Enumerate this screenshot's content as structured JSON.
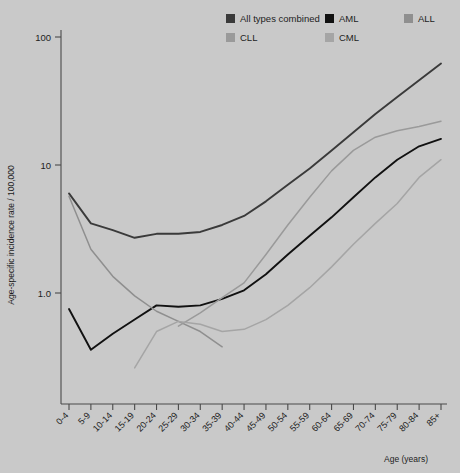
{
  "chart_data": {
    "type": "line",
    "title": "",
    "xlabel": "Age (years)",
    "ylabel": "Age-specific incidence rate / 100,000",
    "yscale": "log",
    "ylim": [
      0.22,
      100
    ],
    "ytick_labels": [
      "100",
      "10",
      "1.0"
    ],
    "ytick_values": [
      100,
      10,
      1.0
    ],
    "grid": false,
    "legend_position": "top",
    "categories": [
      "0-4",
      "5-9",
      "10-14",
      "15-19",
      "20-24",
      "25-29",
      "30-34",
      "35-39",
      "40-44",
      "45-49",
      "50-54",
      "55-59",
      "60-64",
      "65-69",
      "70-74",
      "75-79",
      "80-84",
      "85+"
    ],
    "series": [
      {
        "name": "All types combined",
        "color": "#3a3a3a",
        "values": [
          6.0,
          3.5,
          3.1,
          2.7,
          2.9,
          2.9,
          3.0,
          3.4,
          4.0,
          5.2,
          7.0,
          9.4,
          13.0,
          18.0,
          25.0,
          34.0,
          46.0,
          62.0
        ]
      },
      {
        "name": "AML",
        "color": "#111111",
        "values": [
          0.75,
          0.36,
          0.48,
          0.62,
          0.8,
          0.78,
          0.8,
          0.9,
          1.05,
          1.4,
          2.0,
          2.8,
          3.9,
          5.6,
          8.0,
          11.0,
          14.0,
          16.0
        ]
      },
      {
        "name": "ALL",
        "color": "#8f8f8f",
        "values": [
          5.7,
          2.2,
          1.35,
          0.95,
          0.72,
          0.6,
          0.5,
          0.38,
          null,
          null,
          null,
          null,
          null,
          null,
          null,
          null,
          null,
          null
        ]
      },
      {
        "name": "CLL",
        "color": "#9a9a9a",
        "values": [
          null,
          null,
          null,
          null,
          null,
          0.55,
          0.7,
          0.92,
          1.2,
          2.0,
          3.4,
          5.6,
          9.0,
          13.0,
          16.5,
          18.5,
          20.0,
          22.0
        ]
      },
      {
        "name": "CML",
        "color": "#a5a5a5",
        "values": [
          null,
          null,
          null,
          0.26,
          0.5,
          0.6,
          0.57,
          0.5,
          0.52,
          0.62,
          0.8,
          1.1,
          1.6,
          2.4,
          3.5,
          5.0,
          8.0,
          11.0
        ]
      }
    ]
  },
  "legend": {
    "entries": [
      {
        "label": "All types combined",
        "color": "#3a3a3a"
      },
      {
        "label": "AML",
        "color": "#111111"
      },
      {
        "label": "ALL",
        "color": "#8f8f8f"
      },
      {
        "label": "CLL",
        "color": "#9a9a9a"
      },
      {
        "label": "CML",
        "color": "#a5a5a5"
      }
    ]
  },
  "axes": {
    "y_title": "Age-specific incidence rate / 100,000",
    "x_title": "Age (years)",
    "y_ticks": [
      "100",
      "10",
      "1.0"
    ],
    "x_ticks": [
      "0-4",
      "5-9",
      "10-14",
      "15-19",
      "20-24",
      "25-29",
      "30-34",
      "35-39",
      "40-44",
      "45-49",
      "50-54",
      "55-59",
      "60-64",
      "65-69",
      "70-74",
      "75-79",
      "80-84",
      "85+"
    ]
  },
  "colors": {
    "background": "#c9c9c9",
    "axis": "#4a4a4a",
    "text": "#1d1d1d"
  }
}
